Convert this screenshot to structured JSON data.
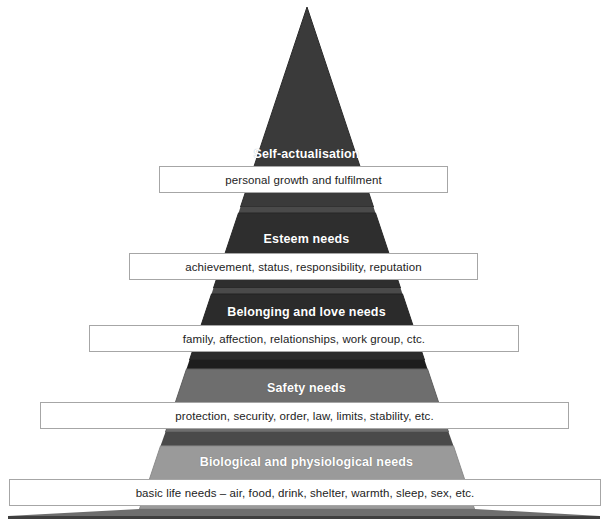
{
  "diagram": {
    "type": "pyramid",
    "name": "Maslow's Hierarchy of Needs",
    "orientation": "apex-top",
    "tier_count": 5,
    "colors": {
      "tier_self_actualisation": "#3a3a3a",
      "tier_esteem": "#2e2e2e",
      "tier_belonging": "#2b2b2b",
      "tier_safety": "#6e6e6e",
      "tier_biological": "#9a9a9a",
      "separator_band": "#4a4a4a",
      "box_fill": "#ffffff",
      "box_border": "#a6a6a6",
      "title_text": "#ffffff",
      "box_text": "#232323",
      "background": "#ffffff"
    },
    "tiers": [
      {
        "id": "self-actualisation",
        "rank": 5,
        "title": "Self-actualisation",
        "description": "personal growth and fulfilment",
        "fill": "#3a3a3a"
      },
      {
        "id": "esteem",
        "rank": 4,
        "title": "Esteem needs",
        "description": "achievement, status, responsibility, reputation",
        "fill": "#2e2e2e"
      },
      {
        "id": "belonging-and-love",
        "rank": 3,
        "title": "Belonging and love needs",
        "description": "family, affection, relationships, work group, ctc.",
        "fill": "#2b2b2b"
      },
      {
        "id": "safety",
        "rank": 2,
        "title": "Safety needs",
        "description": "protection, security, order, law, limits, stability, etc.",
        "fill": "#6e6e6e"
      },
      {
        "id": "biological-and-physiological",
        "rank": 1,
        "title": "Biological and physiological needs",
        "description": "basic life needs – air, food, drink, shelter, warmth, sleep, sex, etc.",
        "fill": "#9a9a9a"
      }
    ]
  }
}
